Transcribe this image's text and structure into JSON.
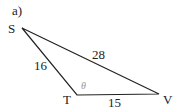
{
  "figure": {
    "part_label": "a)",
    "vertices": {
      "S": {
        "label": "S",
        "x": 22,
        "y": 28
      },
      "T": {
        "label": "T",
        "x": 77,
        "y": 95
      },
      "V": {
        "label": "V",
        "x": 159,
        "y": 94
      }
    },
    "sides": {
      "ST": {
        "label": "16"
      },
      "SV": {
        "label": "28"
      },
      "TV": {
        "label": "15"
      }
    },
    "angle": {
      "vertex": "T",
      "label": "θ"
    },
    "colors": {
      "line": "#222222",
      "text": "#222222",
      "angle_label": "#9a9a9a"
    }
  }
}
